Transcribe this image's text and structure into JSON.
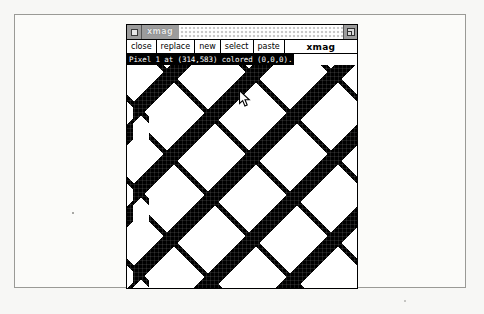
{
  "window": {
    "title": "xmag",
    "titlebar": {
      "menu_button_icon": "window-menu-icon",
      "resize_button_icon": "maximize-icon"
    },
    "menubar": {
      "items": [
        {
          "label": "close",
          "name": "menu-item-close"
        },
        {
          "label": "replace",
          "name": "menu-item-replace"
        },
        {
          "label": "new",
          "name": "menu-item-new"
        },
        {
          "label": "select",
          "name": "menu-item-select"
        },
        {
          "label": "paste",
          "name": "menu-item-paste"
        }
      ],
      "app_label": "xmag"
    },
    "status": {
      "text": "Pixel 1 at (314,583) colored (0,0,0).",
      "pixel_index": 1,
      "pixel_x": 314,
      "pixel_y": 583,
      "pixel_color_rgb": "(0,0,0)",
      "foreground": "#ffffff",
      "background": "#000000"
    },
    "magnifier": {
      "description": "magnified-pixel-view",
      "pattern": "diagonal diamond lattice of black pixels on white",
      "cursor_icon": "mouse-pointer-arrow"
    }
  },
  "colors": {
    "window_border": "#000000",
    "titlebar_fill": "#9c9c9c",
    "titlebar_stipple": "#c9c9c9",
    "menu_background": "#ffffff",
    "page_background": "#f7f7f5",
    "page_frame_border": "#9a9a96",
    "ink": "#000000"
  }
}
